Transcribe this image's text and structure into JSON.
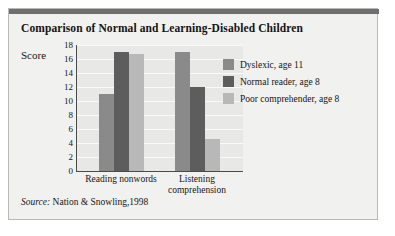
{
  "figure": {
    "title": "Comparison of Normal and Learning-Disabled Children",
    "source_prefix": "Source:",
    "source_text": " Nation & Snowling,1998",
    "rule_color": "#6f6f6f",
    "panel_bg": "#f1f1ef",
    "plot_bg": "#e8e8e6",
    "axis_color": "#4a4a4a"
  },
  "legend": {
    "position": "right",
    "entries": [
      {
        "label": "Dyslexic, age 11",
        "color": "#8a8a8a"
      },
      {
        "label": "Normal reader, age 8",
        "color": "#5d5d5d"
      },
      {
        "label": "Poor comprehender, age 8",
        "color": "#b8b8b8"
      }
    ]
  },
  "chart_data": {
    "type": "bar",
    "title": "Comparison of Normal and Learning-Disabled Children",
    "xlabel": "",
    "ylabel": "Score",
    "ylim": [
      0,
      18
    ],
    "yticks": [
      18,
      16,
      14,
      12,
      10,
      8,
      6,
      4,
      2,
      0
    ],
    "grid": true,
    "categories": [
      "Reading nonwords",
      "Listening comprehension"
    ],
    "series": [
      {
        "name": "Dyslexic, age 11",
        "color": "#8a8a8a",
        "values": [
          11,
          17
        ]
      },
      {
        "name": "Normal reader, age 8",
        "color": "#5d5d5d",
        "values": [
          17,
          12
        ]
      },
      {
        "name": "Poor comprehender, age 8",
        "color": "#b8b8b8",
        "values": [
          16.7,
          4.6
        ]
      }
    ]
  }
}
